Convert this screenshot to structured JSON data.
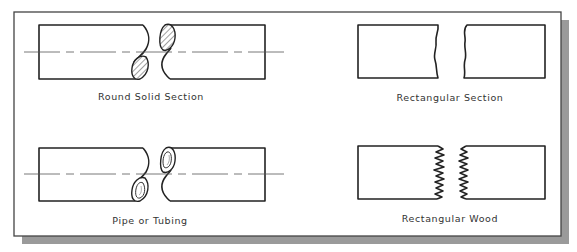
{
  "figure": {
    "colors": {
      "background": "#ffffff",
      "frame_border": "#444444",
      "shadow": "#9a9a9a",
      "line": "#222222",
      "label": "#333333"
    },
    "panels": [
      {
        "id": "round-solid",
        "label": "Round Solid Section",
        "break_style": "S-break with hatched ellipses",
        "has_centerline": true
      },
      {
        "id": "rectangular",
        "label": "Rectangular Section",
        "break_style": "freehand wavy break",
        "has_centerline": false
      },
      {
        "id": "pipe",
        "label": "Pipe or Tubing",
        "break_style": "S-break with hollow double-ellipses",
        "has_centerline": true
      },
      {
        "id": "rect-wood",
        "label": "Rectangular Wood",
        "break_style": "jagged zig-zag splintered break",
        "has_centerline": false
      }
    ]
  }
}
